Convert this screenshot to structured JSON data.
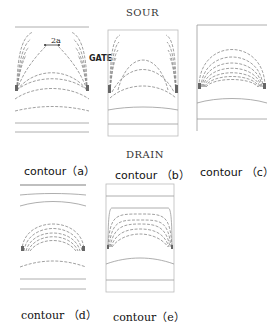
{
  "figure": {
    "top_label": "SOUR",
    "bottom_label": "DRAIN",
    "gate_label": "GATE",
    "dimension_label": "2a",
    "panels": [
      {
        "id": "a",
        "caption": "contour（a）"
      },
      {
        "id": "b",
        "caption": "contour （b）"
      },
      {
        "id": "c",
        "caption": "contour （c）"
      },
      {
        "id": "d",
        "caption": "contour （d）"
      },
      {
        "id": "e",
        "caption": "contour（e）"
      }
    ]
  },
  "colors": {
    "line": "#888888",
    "frame": "#bbbbbb",
    "text": "#111111"
  }
}
